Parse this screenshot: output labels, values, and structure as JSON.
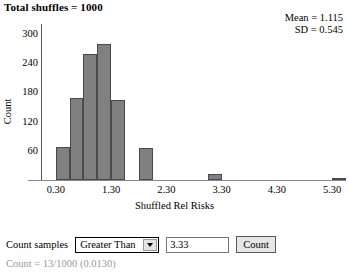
{
  "header": {
    "title": "Total shuffles = 1000",
    "stats": {
      "mean_line": "Mean = 1.115",
      "sd_line": "SD = 0.545",
      "mean_value": 1.115,
      "sd_value": 0.545
    }
  },
  "chart_data": {
    "type": "bar",
    "title": "",
    "xlabel": "Shuffled Rel Risks",
    "ylabel": "Count",
    "grid": false,
    "legend": null,
    "xlim": [
      0.05,
      5.55
    ],
    "ylim": [
      0,
      320
    ],
    "xticks": [
      "0.30",
      "1.30",
      "2.30",
      "3.30",
      "4.30",
      "5.30"
    ],
    "xtick_values": [
      0.3,
      1.3,
      2.3,
      3.3,
      4.3,
      5.3
    ],
    "yticks": [
      "60",
      "120",
      "180",
      "240",
      "300"
    ],
    "ytick_values": [
      60,
      120,
      180,
      240,
      300
    ],
    "bin_width": 0.25,
    "bin_starts": [
      0.3,
      0.55,
      0.8,
      1.05,
      1.3,
      1.8,
      3.05,
      5.3
    ],
    "categories": [
      "0.30",
      "0.55",
      "0.80",
      "1.05",
      "1.30",
      "1.80",
      "3.05",
      "5.30"
    ],
    "values": [
      68,
      168,
      258,
      278,
      165,
      65,
      13,
      5
    ]
  },
  "controls": {
    "count_samples_label": "Count samples",
    "comparison": {
      "selected": "Greater Than",
      "caret_icon": "chevron-down-icon"
    },
    "threshold_value": "3.33",
    "threshold_placeholder": "",
    "count_button_label": "Count"
  },
  "result": {
    "text": "Count = 13/1000 (0.0130)"
  }
}
